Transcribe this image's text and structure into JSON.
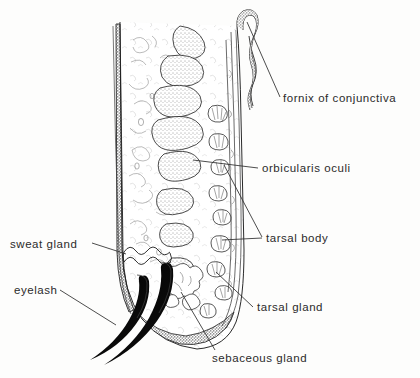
{
  "figure": {
    "background_color": "#fdfdfc",
    "ink_color": "#1a1a1a",
    "label_color": "#2b2b2b",
    "width": 420,
    "height": 378
  },
  "labels": [
    {
      "id": "fornix",
      "text": "fornix of conjunctiva",
      "x": 283,
      "y": 93,
      "side": "right"
    },
    {
      "id": "orbicularis",
      "text": "orbicularis oculi",
      "x": 262,
      "y": 163,
      "side": "right"
    },
    {
      "id": "tarsal-body",
      "text": "tarsal body",
      "x": 266,
      "y": 233,
      "side": "right"
    },
    {
      "id": "tarsal-gland",
      "text": "tarsal gland",
      "x": 257,
      "y": 302,
      "side": "right"
    },
    {
      "id": "sebaceous-gland",
      "text": "sebaceous gland",
      "x": 212,
      "y": 353,
      "side": "bottom"
    },
    {
      "id": "sweat-gland",
      "text": "sweat gland",
      "x": 10,
      "y": 239,
      "side": "left"
    },
    {
      "id": "eyelash",
      "text": "eyelash",
      "x": 14,
      "y": 285,
      "side": "left"
    }
  ],
  "structures": [
    {
      "id": "skin-epidermis",
      "name": "skin / epidermis (stippled dark band, anterior border)"
    },
    {
      "id": "orbicularis-bundles",
      "name": "orbicularis oculi muscle bundles (stippled ovals)"
    },
    {
      "id": "tarsal-plate",
      "name": "tarsal plate with meibomian acini"
    },
    {
      "id": "conjunctiva",
      "name": "palpebral conjunctiva (posterior border)"
    },
    {
      "id": "fornix-fold",
      "name": "conjunctival fornix hairpin fold"
    },
    {
      "id": "eyelash-hairs",
      "name": "eyelash hairs (solid black tapered curves)"
    },
    {
      "id": "sweat-gland-coil",
      "name": "coiled sweat gland tubule near lid margin"
    },
    {
      "id": "sebaceous-cluster",
      "name": "sebaceous gland cluster at lid margin"
    },
    {
      "id": "lid-margin",
      "name": "lid margin (dark stippled inferior border)"
    }
  ]
}
